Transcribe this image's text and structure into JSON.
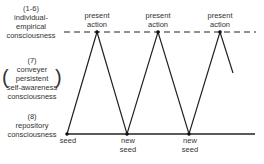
{
  "levels": {
    "individual": {
      "number": "(1-6)",
      "line1": "individual-",
      "line2": "empirical",
      "line3": "consciousness"
    },
    "conveyer": {
      "number": "(7)",
      "line1": "conveyer",
      "line2": "persistent",
      "line3": "self-awareness",
      "line4": "consciousness"
    },
    "repository": {
      "number": "(8)",
      "line1": "repository",
      "line2": "consciousness"
    }
  },
  "peaks": [
    {
      "line1": "present",
      "line2": "action"
    },
    {
      "line1": "present",
      "line2": "action"
    },
    {
      "line1": "present",
      "line2": "action"
    }
  ],
  "seeds": [
    {
      "line1": "seed",
      "line2": ""
    },
    {
      "line1": "new",
      "line2": "seed"
    },
    {
      "line1": "new",
      "line2": "seed"
    }
  ],
  "geometry": {
    "top_line_y": 32,
    "bottom_line_y": 134,
    "top_line_x": [
      64,
      256
    ],
    "bottom_line_x": [
      67,
      255
    ],
    "zigzag_points": [
      [
        67,
        134
      ],
      [
        97,
        32
      ],
      [
        127,
        134
      ],
      [
        158,
        32
      ],
      [
        189,
        134
      ],
      [
        220,
        32
      ],
      [
        233,
        73
      ]
    ]
  },
  "colors": {
    "line": "#222222",
    "text": "#333333",
    "background": "#ffffff"
  }
}
